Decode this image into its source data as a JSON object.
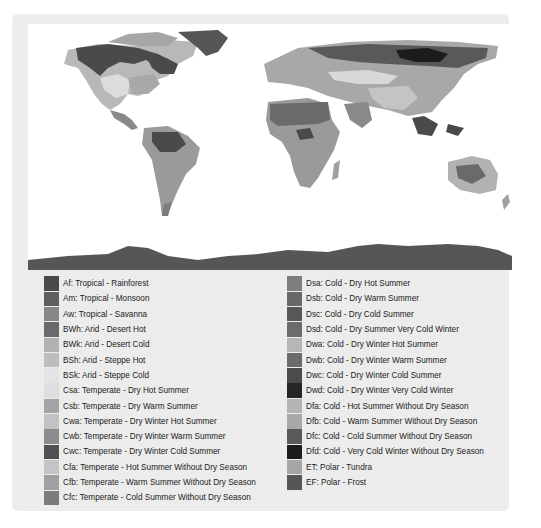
{
  "map": {
    "description": "Köppen climate classification world map (grayscale)",
    "ocean_color": "#ffffff",
    "tones": {
      "dark": "#4a4a4a",
      "mid_dark": "#6e6e6e",
      "mid": "#8f8f8f",
      "light": "#b3b3b3",
      "pale": "#d2d2d2",
      "black": "#1e1e1e"
    }
  },
  "legend": {
    "left": [
      {
        "label": "Af: Tropical - Rainforest",
        "color": "#4a4a4a"
      },
      {
        "label": "Am: Tropical - Monsoon",
        "color": "#5e5e5e"
      },
      {
        "label": "Aw: Tropical  - Savanna",
        "color": "#888888"
      },
      {
        "label": "BWh: Arid - Desert Hot",
        "color": "#6a6a6a"
      },
      {
        "label": "BWk: Arid - Desert Cold",
        "color": "#b2b2b2"
      },
      {
        "label": "BSh: Arid - Steppe Hot",
        "color": "#bdbdbd"
      },
      {
        "label": "BSk: Arid - Steppe Cold",
        "color": "#e4e4e4"
      },
      {
        "label": "Csa: Temperate - Dry Hot Summer",
        "color": "#dedede"
      },
      {
        "label": "Csb: Temperate - Dry Warm Summer",
        "color": "#a4a4a4"
      },
      {
        "label": "Cwa: Temperate - Dry Winter Hot Summer",
        "color": "#c2c2c2"
      },
      {
        "label": "Cwb: Temperate - Dry Winter Warm Summer",
        "color": "#8c8c8c"
      },
      {
        "label": "Cwc: Temperate - Dry Winter Cold Summer",
        "color": "#505050"
      },
      {
        "label": "Cfa: Temperate - Hot Summer Without Dry Season",
        "color": "#c4c4c4"
      },
      {
        "label": "Cfb: Temperate - Warm Summer Without Dry Season",
        "color": "#a0a0a0"
      },
      {
        "label": "Cfc: Temperate - Cold Summer Without Dry Season",
        "color": "#7c7c7c"
      }
    ],
    "right": [
      {
        "label": "Dsa: Cold - Dry Hot Summer",
        "color": "#7e7e7e"
      },
      {
        "label": "Dsb: Cold - Dry Warm Summer",
        "color": "#686868"
      },
      {
        "label": "Dsc: Cold - Dry Cold Summer",
        "color": "#575757"
      },
      {
        "label": "Dsd: Cold - Dry Summer Very Cold Winter",
        "color": "#6c6c6c"
      },
      {
        "label": "Dwa: Cold - Dry Winter Hot Summer",
        "color": "#b6b6b6"
      },
      {
        "label": "Dwb: Cold - Dry Winter Warm Summer",
        "color": "#6a6a6a"
      },
      {
        "label": "Dwc: Cold - Dry Winter Cold Summer",
        "color": "#4c4c4c"
      },
      {
        "label": "Dwd: Cold - Dry Winter Very Cold Winter",
        "color": "#252525"
      },
      {
        "label": "Dfa: Cold - Hot Summer Without Dry Season",
        "color": "#b4b4b4"
      },
      {
        "label": "Dfb: Cold - Warm Summer Without Dry Season",
        "color": "#a8a8a8"
      },
      {
        "label": "Dfc: Cold - Cold Summer Without Dry Season",
        "color": "#595959"
      },
      {
        "label": "Dfd: Cold - Very Cold Winter Without Dry Season",
        "color": "#1c1c1c"
      },
      {
        "label": "ET: Polar - Tundra",
        "color": "#a6a6a6"
      },
      {
        "label": "EF: Polar - Frost",
        "color": "#565656"
      }
    ]
  }
}
